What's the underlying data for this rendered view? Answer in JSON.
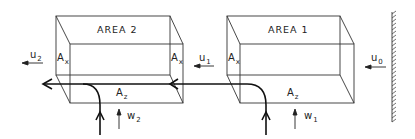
{
  "diagram": {
    "type": "flow-box-schematic",
    "boxes": [
      {
        "id": "area2",
        "title": "AREA 2",
        "side_area_left": "A",
        "side_area_left_sub": "x",
        "side_area_right": "A",
        "side_area_right_sub": "x",
        "bottom_area": "A",
        "bottom_area_sub": "z"
      },
      {
        "id": "area1",
        "title": "AREA 1",
        "side_area_left": "A",
        "side_area_left_sub": "x",
        "bottom_area": "A",
        "bottom_area_sub": "z"
      }
    ],
    "velocities": {
      "u0": {
        "symbol": "u",
        "sub": "0"
      },
      "u1": {
        "symbol": "u",
        "sub": "1"
      },
      "u2": {
        "symbol": "u",
        "sub": "2"
      },
      "w1": {
        "symbol": "w",
        "sub": "1"
      },
      "w2": {
        "symbol": "w",
        "sub": "2"
      }
    },
    "wall": {
      "label": "",
      "hatched": true
    },
    "colors": {
      "line": "#222222",
      "background": "#ffffff"
    }
  }
}
